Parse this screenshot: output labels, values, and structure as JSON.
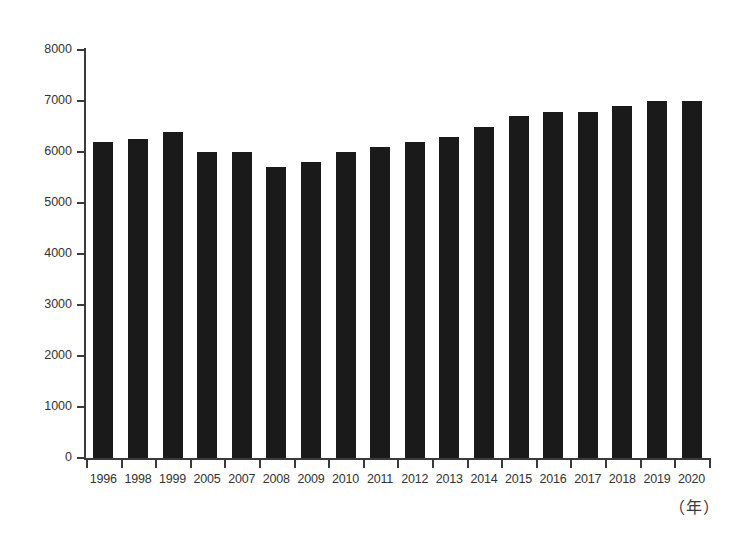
{
  "chart_data": {
    "type": "bar",
    "title": "",
    "subtitle": "",
    "xlabel": "（年）",
    "ylabel": "",
    "categories": [
      "1996",
      "1998",
      "1999",
      "2005",
      "2007",
      "2008",
      "2009",
      "2010",
      "2011",
      "2012",
      "2013",
      "2014",
      "2015",
      "2016",
      "2017",
      "2018",
      "2019",
      "2020"
    ],
    "values": [
      6200,
      6250,
      6400,
      6000,
      6000,
      5700,
      5800,
      6000,
      6100,
      6200,
      6300,
      6500,
      6700,
      6780,
      6780,
      6900,
      7000,
      7000
    ],
    "series": [
      {
        "name": "",
        "values": [
          6200,
          6250,
          6400,
          6000,
          6000,
          5700,
          5800,
          6000,
          6100,
          6200,
          6300,
          6500,
          6700,
          6780,
          6780,
          6900,
          7000,
          7000
        ]
      }
    ],
    "ylim": [
      0,
      8000
    ],
    "y_ticks": [
      0,
      1000,
      2000,
      3000,
      4000,
      5000,
      6000,
      7000,
      8000
    ],
    "y_tick_labels": [
      "0",
      "1000",
      "2000",
      "3000",
      "4000",
      "5000",
      "6000",
      "7000",
      "8000"
    ],
    "grid": false,
    "legend": null,
    "legend_position": "none",
    "bar_color": "#1a1a1a",
    "axis_color": "#3a3a3a",
    "background_color": "#ffffff"
  },
  "axis": {
    "unit_label": "（年）"
  }
}
